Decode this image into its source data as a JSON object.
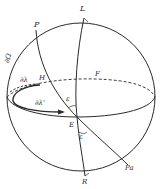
{
  "figure": {
    "type": "celestial-sphere",
    "stroke_color": "#2a2a2a",
    "background": "#ffffff"
  },
  "labels": {
    "L": "L",
    "P": "P",
    "d_omega": "∂Ω",
    "d_lambda": "∂λ",
    "H": "H",
    "d_lambda_prime": "∂λ'",
    "epsilon_upper": "ε",
    "E": "E",
    "epsilon_lower": "ε",
    "F": "F",
    "Pa": "Pa",
    "R": "R"
  }
}
